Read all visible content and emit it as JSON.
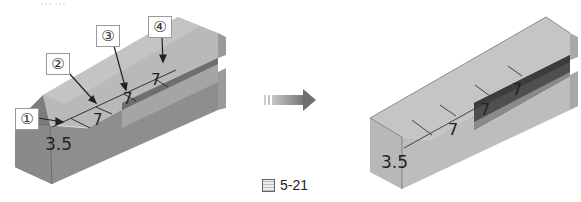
{
  "figure": {
    "caption_prefix": "图",
    "caption_number": "5-21",
    "top_text_cropped": "……"
  },
  "before": {
    "callouts": [
      {
        "label": "①",
        "x": 15,
        "y": 108
      },
      {
        "label": "②",
        "x": 46,
        "y": 53
      },
      {
        "label": "③",
        "x": 96,
        "y": 25
      },
      {
        "label": "④",
        "x": 148,
        "y": 16
      }
    ],
    "dimensions": [
      {
        "value": "3.5",
        "x": 45,
        "y": 134,
        "size": 17
      },
      {
        "value": "7",
        "x": 93,
        "y": 111,
        "size": 15
      },
      {
        "value": "7",
        "x": 123,
        "y": 90,
        "size": 15
      },
      {
        "value": "7",
        "x": 151,
        "y": 71,
        "size": 15
      }
    ]
  },
  "after": {
    "dimensions": [
      {
        "value": "3.5",
        "x": 381,
        "y": 152,
        "size": 17
      },
      {
        "value": "7",
        "x": 448,
        "y": 120,
        "size": 16
      },
      {
        "value": "7",
        "x": 480,
        "y": 100,
        "size": 16
      },
      {
        "value": "7",
        "x": 512,
        "y": 80,
        "size": 16
      }
    ]
  },
  "arrow": {
    "direction": "right",
    "color": "#8a8a8a"
  },
  "colors": {
    "top_face": "#b9b9b9",
    "front_face": "#8e8e8e",
    "end_face": "#a2a2a2",
    "slot": "#5a5a5a",
    "after_front": "#bdbdbd",
    "after_top": "#c8c8c8"
  }
}
